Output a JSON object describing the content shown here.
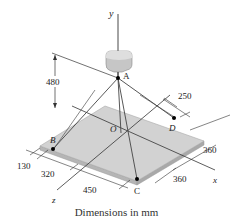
{
  "diagram": {
    "caption": "Dimensions in mm",
    "axes": {
      "x": "x",
      "y": "y",
      "z": "z"
    },
    "points": {
      "A": "A",
      "B": "B",
      "C": "C",
      "D": "D",
      "O": "O"
    },
    "dimensions": {
      "height_A": "480",
      "D_offset_x": "250",
      "right_edge_upper": "360",
      "right_edge_lower": "360",
      "left_130": "130",
      "left_320": "320",
      "front_450": "450"
    },
    "colors": {
      "plate_top": "#cfcfcf",
      "plate_edge": "#a9a9a9",
      "block": "#c8c8c8",
      "line": "#333333"
    }
  }
}
